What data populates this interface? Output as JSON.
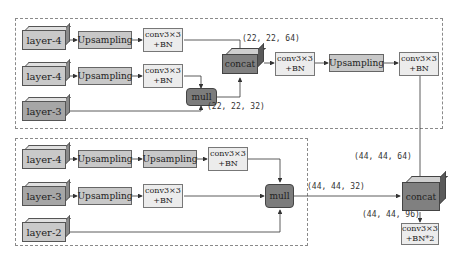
{
  "top_block": {
    "row1": {
      "input": "layer-4",
      "up": "Upsampling",
      "conv_line1": "conv3×3",
      "conv_line2": "+BN"
    },
    "row2": {
      "input": "layer-4",
      "up": "Upsampling",
      "conv_line1": "conv3×3",
      "conv_line2": "+BN"
    },
    "row3": {
      "input": "layer-3"
    },
    "mull": "mull",
    "concat": "concat",
    "conv_a_line1": "conv3×3",
    "conv_a_line2": "+BN",
    "up_after": "Upsampling",
    "conv_b_line1": "conv3×3",
    "conv_b_line2": "+BN",
    "dim_concat_in": "(22, 22, 64)",
    "dim_mull_out": "(22, 22, 32)"
  },
  "bottom_block": {
    "row1": {
      "input": "layer-4",
      "up1": "Upsampling",
      "up2": "Upsampling",
      "conv_line1": "conv3×3",
      "conv_line2": "+BN"
    },
    "row2": {
      "input": "layer-3",
      "up": "Upsampling",
      "conv_line1": "conv3×3",
      "conv_line2": "+BN"
    },
    "row3": {
      "input": "layer-2"
    },
    "mull": "mull",
    "dim_mull_out": "(44, 44, 32)"
  },
  "final": {
    "concat": "concat",
    "conv_line1": "conv3×3",
    "conv_line2": "+BN*2",
    "dim_top_in": "(44, 44, 64)",
    "dim_out": "(44, 44, 96)"
  },
  "colors": {
    "layer_fill": "#c9c9c9",
    "upsampling_fill": "#c8c8c8",
    "conv_fill": "#ececec",
    "op_fill": "#7c7c7c",
    "line": "#333333"
  }
}
